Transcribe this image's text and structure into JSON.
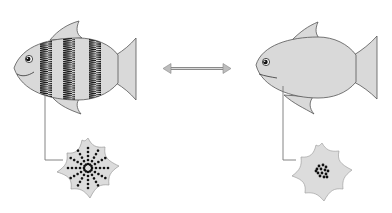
{
  "diagram": {
    "colors": {
      "background": "#ffffff",
      "fish_fill": "#d9d9d9",
      "outline": "#555555",
      "stripe": "#1a1a1a",
      "leader_line": "#777777",
      "arrow": "#8a8a8a",
      "cell_fill": "#dcdcdc",
      "pigment": "#111111"
    },
    "left": {
      "fish": {
        "label": "striped-fish",
        "stripes": 3
      },
      "cell": {
        "label": "chromatophore-dispersed",
        "pigment_state": "dispersed",
        "spokes": 12
      }
    },
    "connector": {
      "type": "double-headed-arrow"
    },
    "right": {
      "fish": {
        "label": "plain-fish",
        "stripes": 0
      },
      "cell": {
        "label": "chromatophore-aggregated",
        "pigment_state": "aggregated"
      }
    }
  }
}
